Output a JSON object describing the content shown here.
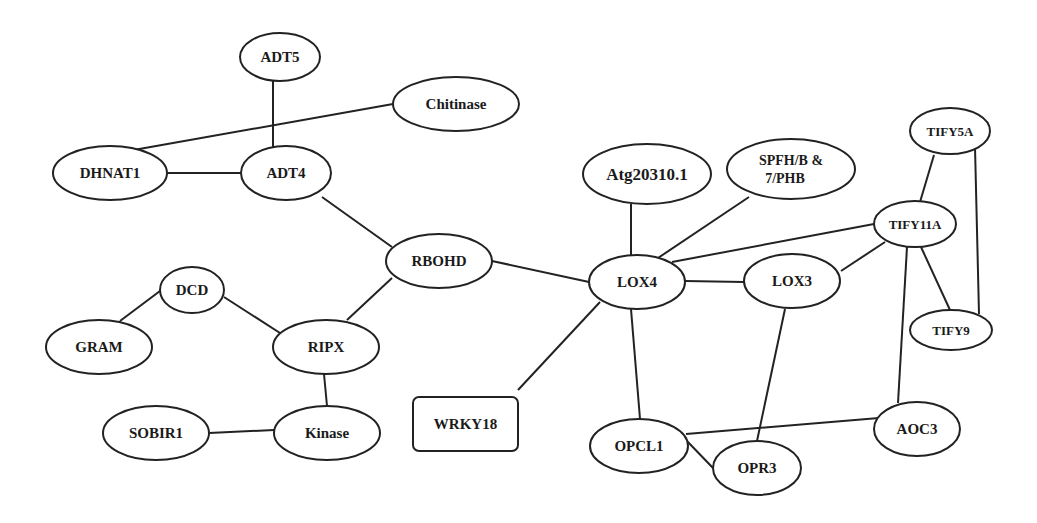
{
  "diagram": {
    "type": "network",
    "nodes": [
      {
        "id": "ADT5",
        "label": "ADT5",
        "shape": "ellipse",
        "cx": 280,
        "cy": 57,
        "rx": 40,
        "ry": 24,
        "fs": 15
      },
      {
        "id": "Chitinase",
        "label": "Chitinase",
        "shape": "ellipse",
        "cx": 456,
        "cy": 104,
        "rx": 63,
        "ry": 27,
        "fs": 15
      },
      {
        "id": "DHNAT1",
        "label": "DHNAT1",
        "shape": "ellipse",
        "cx": 110,
        "cy": 173,
        "rx": 57,
        "ry": 27,
        "fs": 15
      },
      {
        "id": "ADT4",
        "label": "ADT4",
        "shape": "ellipse",
        "cx": 286,
        "cy": 173,
        "rx": 45,
        "ry": 27,
        "fs": 15
      },
      {
        "id": "RBOHD",
        "label": "RBOHD",
        "shape": "ellipse",
        "cx": 439,
        "cy": 261,
        "rx": 53,
        "ry": 27,
        "fs": 15
      },
      {
        "id": "DCD",
        "label": "DCD",
        "shape": "ellipse",
        "cx": 192,
        "cy": 290,
        "rx": 32,
        "ry": 23,
        "fs": 15
      },
      {
        "id": "GRAM",
        "label": "GRAM",
        "shape": "ellipse",
        "cx": 99,
        "cy": 347,
        "rx": 53,
        "ry": 27,
        "fs": 15
      },
      {
        "id": "RIPX",
        "label": "RIPX",
        "shape": "ellipse",
        "cx": 326,
        "cy": 347,
        "rx": 53,
        "ry": 27,
        "fs": 15
      },
      {
        "id": "SOBIR1",
        "label": "SOBIR1",
        "shape": "ellipse",
        "cx": 156,
        "cy": 433,
        "rx": 53,
        "ry": 27,
        "fs": 15
      },
      {
        "id": "Kinase",
        "label": "Kinase",
        "shape": "ellipse",
        "cx": 327,
        "cy": 433,
        "rx": 53,
        "ry": 27,
        "fs": 15
      },
      {
        "id": "WRKY18",
        "label": "WRKY18",
        "shape": "rect",
        "x": 413,
        "y": 397,
        "w": 105,
        "h": 54,
        "fs": 15
      },
      {
        "id": "Atg20310",
        "label": "Atg20310.1",
        "shape": "ellipse",
        "cx": 647,
        "cy": 174,
        "rx": 64,
        "ry": 30,
        "fs": 17
      },
      {
        "id": "SPFH",
        "label": "SPFH/B &",
        "label2": "7/PHB",
        "shape": "ellipse",
        "cx": 791,
        "cy": 169,
        "rx": 64,
        "ry": 30,
        "fs": 14
      },
      {
        "id": "TIFY5A",
        "label": "TIFY5A",
        "shape": "ellipse",
        "cx": 950,
        "cy": 131,
        "rx": 40,
        "ry": 23,
        "fs": 13
      },
      {
        "id": "TIFY11A",
        "label": "TIFY11A",
        "shape": "ellipse",
        "cx": 915,
        "cy": 224,
        "rx": 41,
        "ry": 23,
        "fs": 13
      },
      {
        "id": "LOX4",
        "label": "LOX4",
        "shape": "ellipse",
        "cx": 637,
        "cy": 282,
        "rx": 48,
        "ry": 27,
        "fs": 15
      },
      {
        "id": "LOX3",
        "label": "LOX3",
        "shape": "ellipse",
        "cx": 792,
        "cy": 281,
        "rx": 48,
        "ry": 27,
        "fs": 15
      },
      {
        "id": "TIFY9",
        "label": "TIFY9",
        "shape": "ellipse",
        "cx": 951,
        "cy": 330,
        "rx": 41,
        "ry": 20,
        "fs": 13
      },
      {
        "id": "OPCL1",
        "label": "OPCL1",
        "shape": "ellipse",
        "cx": 639,
        "cy": 446,
        "rx": 49,
        "ry": 27,
        "fs": 15
      },
      {
        "id": "OPR3",
        "label": "OPR3",
        "shape": "ellipse",
        "cx": 757,
        "cy": 468,
        "rx": 44,
        "ry": 27,
        "fs": 15
      },
      {
        "id": "AOC3",
        "label": "AOC3",
        "shape": "ellipse",
        "cx": 917,
        "cy": 429,
        "rx": 43,
        "ry": 27,
        "fs": 15
      }
    ],
    "edges": [
      {
        "from": "ADT5",
        "to": "ADT4",
        "x1": 273,
        "y1": 81,
        "x2": 273,
        "y2": 152
      },
      {
        "from": "Chitinase",
        "to": "DHNAT1",
        "x1": 393,
        "y1": 104,
        "x2": 128,
        "y2": 151
      },
      {
        "from": "DHNAT1",
        "to": "ADT4",
        "x1": 167,
        "y1": 173,
        "x2": 241,
        "y2": 173
      },
      {
        "from": "ADT4",
        "to": "RBOHD",
        "x1": 322,
        "y1": 197,
        "x2": 392,
        "y2": 247
      },
      {
        "from": "RBOHD",
        "to": "LOX4",
        "x1": 492,
        "y1": 261,
        "x2": 589,
        "y2": 282
      },
      {
        "from": "RBOHD",
        "to": "RIPX",
        "x1": 392,
        "y1": 278,
        "x2": 347,
        "y2": 320
      },
      {
        "from": "DCD",
        "to": "GRAM",
        "x1": 160,
        "y1": 291,
        "x2": 120,
        "y2": 321
      },
      {
        "from": "DCD",
        "to": "RIPX",
        "x1": 224,
        "y1": 297,
        "x2": 280,
        "y2": 333
      },
      {
        "from": "RIPX",
        "to": "Kinase",
        "x1": 324,
        "y1": 374,
        "x2": 327,
        "y2": 406
      },
      {
        "from": "SOBIR1",
        "to": "Kinase",
        "x1": 209,
        "y1": 433,
        "x2": 274,
        "y2": 430
      },
      {
        "from": "WRKY18",
        "to": "LOX4",
        "x1": 518,
        "y1": 390,
        "x2": 600,
        "y2": 302
      },
      {
        "from": "Atg20310",
        "to": "LOX4",
        "x1": 631,
        "y1": 204,
        "x2": 631,
        "y2": 256
      },
      {
        "from": "SPFH",
        "to": "LOX4",
        "x1": 749,
        "y1": 197,
        "x2": 658,
        "y2": 258
      },
      {
        "from": "TIFY11A",
        "to": "LOX4",
        "x1": 874,
        "y1": 224,
        "x2": 672,
        "y2": 262
      },
      {
        "from": "LOX4",
        "to": "LOX3",
        "x1": 685,
        "y1": 281,
        "x2": 744,
        "y2": 282
      },
      {
        "from": "LOX3",
        "to": "TIFY11A",
        "x1": 841,
        "y1": 271,
        "x2": 885,
        "y2": 242
      },
      {
        "from": "TIFY5A",
        "to": "TIFY11A",
        "x1": 934,
        "y1": 155,
        "x2": 920,
        "y2": 202
      },
      {
        "from": "TIFY5A",
        "to": "TIFY9",
        "x1": 975,
        "y1": 147,
        "x2": 979,
        "y2": 314
      },
      {
        "from": "TIFY11A",
        "to": "TIFY9",
        "x1": 921,
        "y1": 247,
        "x2": 950,
        "y2": 310
      },
      {
        "from": "TIFY11A",
        "to": "AOC3",
        "x1": 907,
        "y1": 247,
        "x2": 898,
        "y2": 403
      },
      {
        "from": "LOX4",
        "to": "OPCL1",
        "x1": 631,
        "y1": 309,
        "x2": 640,
        "y2": 419
      },
      {
        "from": "LOX3",
        "to": "OPR3",
        "x1": 785,
        "y1": 309,
        "x2": 757,
        "y2": 441
      },
      {
        "from": "OPCL1",
        "to": "AOC3",
        "x1": 686,
        "y1": 434,
        "x2": 879,
        "y2": 418
      },
      {
        "from": "OPCL1",
        "to": "OPR3",
        "x1": 686,
        "y1": 440,
        "x2": 713,
        "y2": 468
      }
    ]
  }
}
